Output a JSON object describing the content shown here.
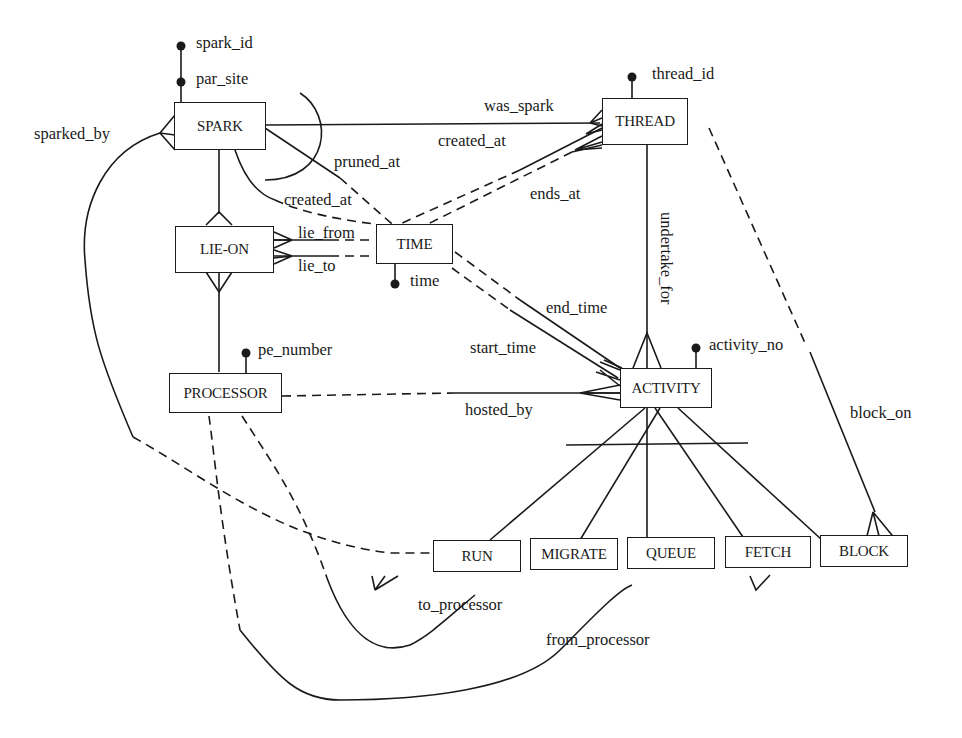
{
  "diagram": {
    "type": "entity-relationship",
    "entities": [
      {
        "id": "spark",
        "label": "SPARK"
      },
      {
        "id": "thread",
        "label": "THREAD"
      },
      {
        "id": "lie_on",
        "label": "LIE-ON"
      },
      {
        "id": "time",
        "label": "TIME"
      },
      {
        "id": "processor",
        "label": "PROCESSOR"
      },
      {
        "id": "activity",
        "label": "ACTIVITY"
      },
      {
        "id": "run",
        "label": "RUN"
      },
      {
        "id": "migrate",
        "label": "MIGRATE"
      },
      {
        "id": "queue",
        "label": "QUEUE"
      },
      {
        "id": "fetch",
        "label": "FETCH"
      },
      {
        "id": "block",
        "label": "BLOCK"
      }
    ],
    "attributes": {
      "spark_id": "spark_id",
      "par_site": "par_site",
      "thread_id": "thread_id",
      "time": "time",
      "pe_number": "pe_number",
      "activity_no": "activity_no"
    },
    "relationships": {
      "sparked_by": "sparked_by",
      "was_spark": "was_spark",
      "created_at_thread": "created_at",
      "ends_at": "ends_at",
      "pruned_at": "pruned_at",
      "created_at_spark": "created_at",
      "lie_from": "lie_from",
      "lie_to": "lie_to",
      "undertake_for": "undertake_for",
      "end_time": "end_time",
      "start_time": "start_time",
      "hosted_by": "hosted_by",
      "block_on": "block_on",
      "to_processor": "to_processor",
      "from_processor": "from_processor"
    },
    "edges": [
      {
        "from": "SPARK",
        "to": "SPARK",
        "label": "sparked_by",
        "style": "solid-to-dashed",
        "via": "RUN"
      },
      {
        "from": "SPARK",
        "to": "THREAD",
        "label": "was_spark",
        "style": "solid"
      },
      {
        "from": "THREAD",
        "to": "TIME",
        "label": "created_at",
        "style": "solid-to-dashed"
      },
      {
        "from": "THREAD",
        "to": "TIME",
        "label": "ends_at",
        "style": "solid-to-dashed"
      },
      {
        "from": "SPARK",
        "to": "TIME",
        "label": "pruned_at",
        "style": "solid-to-dashed"
      },
      {
        "from": "SPARK",
        "to": "TIME",
        "label": "created_at",
        "style": "solid-to-dashed"
      },
      {
        "from": "LIE-ON",
        "to": "TIME",
        "label": "lie_from",
        "style": "solid-to-dashed"
      },
      {
        "from": "LIE-ON",
        "to": "TIME",
        "label": "lie_to",
        "style": "solid-to-dashed"
      },
      {
        "from": "SPARK",
        "to": "LIE-ON",
        "style": "solid"
      },
      {
        "from": "LIE-ON",
        "to": "PROCESSOR",
        "style": "solid"
      },
      {
        "from": "THREAD",
        "to": "ACTIVITY",
        "label": "undertake_for",
        "style": "solid"
      },
      {
        "from": "ACTIVITY",
        "to": "TIME",
        "label": "end_time",
        "style": "solid-to-dashed"
      },
      {
        "from": "ACTIVITY",
        "to": "TIME",
        "label": "start_time",
        "style": "solid-to-dashed"
      },
      {
        "from": "ACTIVITY",
        "to": "PROCESSOR",
        "label": "hosted_by",
        "style": "solid-to-dashed"
      },
      {
        "from": "BLOCK",
        "to": "THREAD",
        "label": "block_on",
        "style": "solid-to-dashed"
      },
      {
        "from": "MIGRATE",
        "to": "PROCESSOR",
        "label": "to_processor",
        "style": "solid-to-dashed"
      },
      {
        "from": "FETCH",
        "to": "PROCESSOR",
        "label": "from_processor",
        "style": "solid-to-dashed"
      },
      {
        "from": "ACTIVITY",
        "to": [
          "RUN",
          "MIGRATE",
          "QUEUE",
          "FETCH",
          "BLOCK"
        ],
        "style": "subtype-partition"
      }
    ]
  }
}
